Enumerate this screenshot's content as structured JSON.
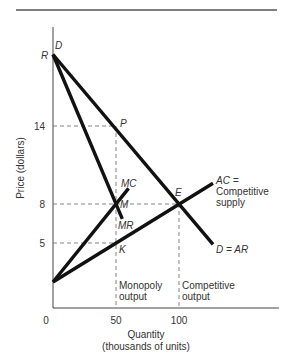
{
  "chart_data": {
    "type": "line",
    "title": "",
    "xlabel": "Quantity",
    "xlabel_sub": "(thousands of units)",
    "ylabel": "Price (dollars)",
    "xlim": [
      0,
      180
    ],
    "ylim": [
      0,
      22
    ],
    "x_ticks": [
      {
        "value": 0,
        "label": "0"
      },
      {
        "value": 50,
        "label": "50"
      },
      {
        "value": 100,
        "label": "100"
      }
    ],
    "y_ticks": [
      {
        "value": 5,
        "label": "5"
      },
      {
        "value": 8,
        "label": "8"
      },
      {
        "value": 14,
        "label": "14"
      }
    ],
    "series": [
      {
        "name": "D = AR",
        "points": [
          [
            0,
            19.5
          ],
          [
            127,
            4.9
          ]
        ]
      },
      {
        "name": "MR",
        "points": [
          [
            0,
            19.5
          ],
          [
            55,
            6.85
          ]
        ]
      },
      {
        "name": "MC",
        "points": [
          [
            0,
            2
          ],
          [
            60,
            9.2
          ]
        ]
      },
      {
        "name": "AC = Competitive supply",
        "points": [
          [
            0,
            2
          ],
          [
            127,
            9.6
          ]
        ]
      }
    ],
    "guides": [
      {
        "name": "price-14",
        "from": [
          0,
          14
        ],
        "to": [
          50,
          14
        ]
      },
      {
        "name": "price-8",
        "from": [
          0,
          8
        ],
        "to": [
          100,
          8
        ]
      },
      {
        "name": "price-5",
        "from": [
          0,
          5
        ],
        "to": [
          50,
          5
        ]
      },
      {
        "name": "monopoly-output",
        "from": [
          50,
          14
        ],
        "to": [
          50,
          0
        ]
      },
      {
        "name": "competitive-output",
        "from": [
          100,
          8
        ],
        "to": [
          100,
          0
        ]
      }
    ],
    "point_labels": [
      {
        "text": "R",
        "at": [
          0,
          19.5
        ],
        "side": "left"
      },
      {
        "text": "D",
        "at": [
          0,
          19.5
        ],
        "side": "top-right"
      },
      {
        "text": "P",
        "at": [
          50,
          14
        ],
        "side": "right"
      },
      {
        "text": "M",
        "at": [
          50,
          8
        ],
        "side": "right"
      },
      {
        "text": "K",
        "at": [
          50,
          5
        ],
        "side": "below-right"
      },
      {
        "text": "E",
        "at": [
          100,
          8
        ],
        "side": "above"
      },
      {
        "text": "MC",
        "at": [
          60,
          9.2
        ],
        "side": "above"
      },
      {
        "text": "MR",
        "at": [
          55,
          6.85
        ],
        "side": "below"
      }
    ],
    "annotations": {
      "ac_label_1": "AC =",
      "ac_label_2": "Competitive",
      "ac_label_3": "supply",
      "d_label": "D = AR",
      "monopoly_1": "Monopoly",
      "monopoly_2": "output",
      "competitive_1": "Competitive",
      "competitive_2": "output"
    }
  }
}
